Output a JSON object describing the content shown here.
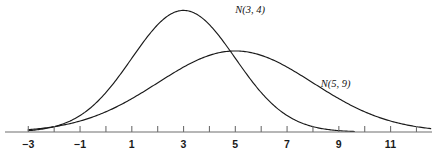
{
  "chart_data": {
    "type": "line",
    "title": "",
    "xlabel": "",
    "ylabel": "",
    "xlim": [
      -3.9,
      12.6
    ],
    "ylim": [
      0,
      0.21
    ],
    "grid": false,
    "legend_position": "inline-annotation",
    "axis": {
      "orientation": "horizontal",
      "tick_step": 1,
      "labeled_tick_step": 2,
      "ticks": [
        -3,
        -2,
        -1,
        0,
        1,
        2,
        3,
        4,
        5,
        6,
        7,
        8,
        9,
        10,
        11,
        12
      ],
      "tick_labels": [
        "−3",
        "",
        "−1",
        "",
        "1",
        "",
        "3",
        "",
        "5",
        "",
        "7",
        "",
        "9",
        "",
        "11",
        ""
      ],
      "labeled_ticks": [
        -3,
        -1,
        1,
        3,
        5,
        7,
        9,
        11
      ],
      "labeled_tick_texts": [
        "−3",
        "−1",
        "1",
        "3",
        "5",
        "7",
        "9",
        "11"
      ]
    },
    "series": [
      {
        "name": "N(3, 4)",
        "label": "N(3, 4)",
        "distribution": "normal",
        "mean": 3,
        "variance": 4,
        "sd": 2,
        "peak_x": 3,
        "peak_y": 0.19947,
        "x_start": -3,
        "x_end": 9.6,
        "label_x": 5.0,
        "label_y": 0.196,
        "color": "#1a1a1a"
      },
      {
        "name": "N(5, 9)",
        "label": "N(5, 9)",
        "distribution": "normal",
        "mean": 5,
        "variance": 9,
        "sd": 3,
        "peak_x": 5,
        "peak_y": 0.13298,
        "x_start": -3,
        "x_end": 12.55,
        "label_x": 8.3,
        "label_y": 0.0745,
        "color": "#1a1a1a"
      }
    ],
    "intersections": [
      {
        "x": 4.26,
        "y": 0.1289
      }
    ]
  }
}
